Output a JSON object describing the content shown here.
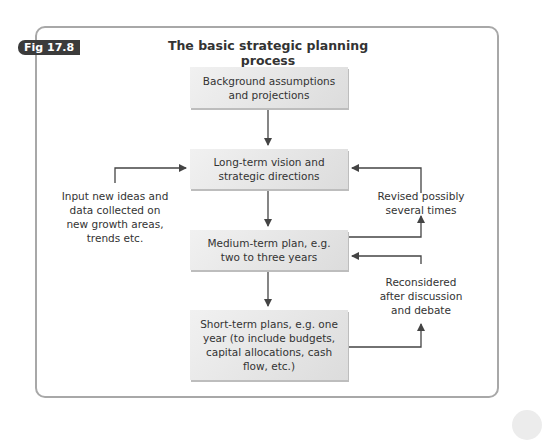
{
  "figure": {
    "label": "Fig 17.8",
    "title": "The basic strategic planning process"
  },
  "boxes": [
    {
      "id": "background",
      "text": "Background assumptions and projections"
    },
    {
      "id": "long-term",
      "text": "Long-term vision and strategic directions"
    },
    {
      "id": "medium-term",
      "text": "Medium-term plan, e.g. two to three years"
    },
    {
      "id": "short-term",
      "text": "Short-term plans, e.g. one year (to include budgets, capital allocations, cash flow, etc.)"
    }
  ],
  "notes": {
    "input": "Input new ideas and data collected on new growth areas, trends etc.",
    "revised": "Revised possibly several times",
    "reconsidered": "Reconsidered after discussion and debate"
  },
  "colors": {
    "frame": "#a8a8a8",
    "tag_bg": "#3b3b3b",
    "box_light": "#f1f1f1",
    "box_dark": "#dcdcdc",
    "arrow": "#444444"
  }
}
